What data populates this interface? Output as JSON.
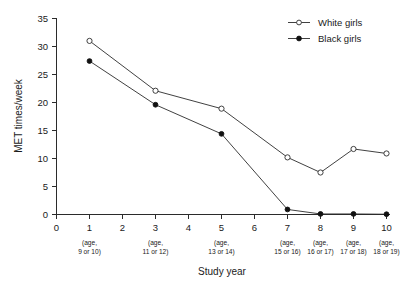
{
  "chart_data": {
    "type": "line",
    "title": "",
    "xlabel": "Study year",
    "ylabel": "MET times/week",
    "xlim": [
      0,
      10
    ],
    "ylim": [
      0,
      35
    ],
    "grid": false,
    "legend_position": "top-right",
    "x_ticks": [
      "0",
      "1",
      "2",
      "3",
      "4",
      "5",
      "6",
      "7",
      "8",
      "9",
      "10"
    ],
    "y_ticks": [
      "0",
      "5",
      "10",
      "15",
      "20",
      "25",
      "30",
      "35"
    ],
    "x_sub_labels": [
      {
        "x": 1,
        "line1": "(age,",
        "line2": "9 or 10)"
      },
      {
        "x": 3,
        "line1": "(age,",
        "line2": "11 or 12)"
      },
      {
        "x": 5,
        "line1": "(age,",
        "line2": "13 or 14)"
      },
      {
        "x": 7,
        "line1": "(age,",
        "line2": "15 or 16)"
      },
      {
        "x": 8,
        "line1": "(age,",
        "line2": "16 or 17)"
      },
      {
        "x": 9,
        "line1": "(age,",
        "line2": "17 or 18)"
      },
      {
        "x": 10,
        "line1": "(age,",
        "line2": "18 or 19)"
      }
    ],
    "series": [
      {
        "name": "White girls",
        "marker": "open-circle",
        "color": "#2b2b2b",
        "x": [
          1,
          3,
          5,
          7,
          8,
          9,
          10
        ],
        "values": [
          31.0,
          22.1,
          18.9,
          10.2,
          7.5,
          11.7,
          10.9
        ]
      },
      {
        "name": "Black girls",
        "marker": "filled-circle",
        "color": "#111111",
        "x": [
          1,
          3,
          5,
          7,
          8,
          9,
          10
        ],
        "values": [
          27.4,
          19.6,
          14.4,
          0.9,
          0.1,
          0.1,
          0.05
        ]
      }
    ]
  },
  "legend": {
    "entries": [
      {
        "label": "White girls",
        "marker": "open-circle"
      },
      {
        "label": "Black girls",
        "marker": "filled-circle"
      }
    ]
  },
  "colors": {
    "axis": "#2b2b2b",
    "white_series": "#ffffff",
    "black_series": "#111111",
    "background": "#ffffff"
  }
}
